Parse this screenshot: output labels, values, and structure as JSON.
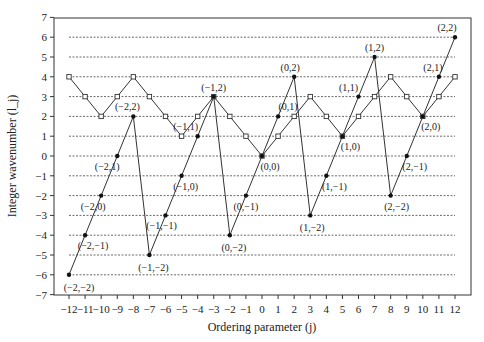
{
  "chart_data": {
    "type": "line",
    "title": "",
    "xlabel": "Ordering parameter (j)",
    "ylabel": "Integer wavenumber (l_j)",
    "xlim": [
      -12,
      12
    ],
    "ylim": [
      -7,
      7
    ],
    "x_ticks": [
      -12,
      -11,
      -10,
      -9,
      -8,
      -7,
      -6,
      -5,
      -4,
      -3,
      -2,
      -1,
      0,
      1,
      2,
      3,
      4,
      5,
      6,
      7,
      8,
      9,
      10,
      11,
      12
    ],
    "y_ticks": [
      -7,
      -6,
      -5,
      -4,
      -3,
      -2,
      -1,
      0,
      1,
      2,
      3,
      4,
      5,
      6,
      7
    ],
    "grid": "dashed horizontal lines at y = -6..6",
    "legend": null,
    "x": [
      -12,
      -11,
      -10,
      -9,
      -8,
      -7,
      -6,
      -5,
      -4,
      -3,
      -2,
      -1,
      0,
      1,
      2,
      3,
      4,
      5,
      6,
      7,
      8,
      9,
      10,
      11,
      12
    ],
    "series": [
      {
        "name": "hollow-square-series",
        "marker": "open-square",
        "values": [
          4,
          3,
          2,
          3,
          4,
          3,
          2,
          1,
          2,
          3,
          2,
          1,
          0,
          1,
          2,
          3,
          2,
          1,
          2,
          3,
          4,
          3,
          2,
          3,
          4
        ]
      },
      {
        "name": "filled-dot-series",
        "marker": "filled-circle",
        "values": [
          -6,
          -4,
          -2,
          0,
          2,
          -5,
          -3,
          -1,
          1,
          3,
          -4,
          -2,
          0,
          2,
          4,
          -3,
          -1,
          1,
          3,
          5,
          -2,
          0,
          2,
          4,
          6
        ]
      }
    ],
    "annotations": [
      {
        "text": "(−2,−2)",
        "x": -12,
        "y": -6
      },
      {
        "text": "(−2,−1)",
        "x": -11,
        "y": -4
      },
      {
        "text": "(−2,0)",
        "x": -10,
        "y": -2
      },
      {
        "text": "(−2,1)",
        "x": -9,
        "y": 0
      },
      {
        "text": "(−2,2)",
        "x": -8,
        "y": 2
      },
      {
        "text": "(−1,−2)",
        "x": -7,
        "y": -5
      },
      {
        "text": "(−1,−1)",
        "x": -6,
        "y": -3
      },
      {
        "text": "(−1,0)",
        "x": -5,
        "y": -1
      },
      {
        "text": "(−1,1)",
        "x": -5,
        "y": 1
      },
      {
        "text": "(−1,2)",
        "x": -3,
        "y": 3
      },
      {
        "text": "(0,−2)",
        "x": -2,
        "y": -4
      },
      {
        "text": "(0,−1)",
        "x": -1,
        "y": -2
      },
      {
        "text": "(0,0)",
        "x": 0,
        "y": 0
      },
      {
        "text": "(0,1)",
        "x": 1,
        "y": 2
      },
      {
        "text": "(0,2)",
        "x": 2,
        "y": 4
      },
      {
        "text": "(1,−2)",
        "x": 3,
        "y": -3
      },
      {
        "text": "(1,−1)",
        "x": 4,
        "y": -1
      },
      {
        "text": "(1,0)",
        "x": 5,
        "y": 1
      },
      {
        "text": "(1,1)",
        "x": 6,
        "y": 3
      },
      {
        "text": "(1,2)",
        "x": 7,
        "y": 5
      },
      {
        "text": "(2,−2)",
        "x": 8,
        "y": -2
      },
      {
        "text": "(2,−1)",
        "x": 9,
        "y": 0
      },
      {
        "text": "(2,0)",
        "x": 10,
        "y": 2
      },
      {
        "text": "(2,1)",
        "x": 11,
        "y": 4
      },
      {
        "text": "(2,2)",
        "x": 12,
        "y": 6
      }
    ]
  }
}
